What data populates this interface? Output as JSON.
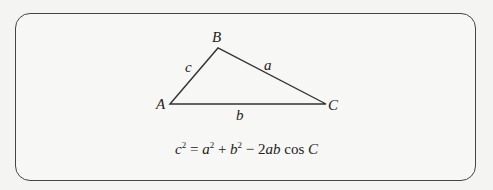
{
  "figure": {
    "type": "triangle-diagram",
    "vertices": [
      {
        "label": "A",
        "x": 170,
        "y": 104
      },
      {
        "label": "B",
        "x": 218,
        "y": 48
      },
      {
        "label": "C",
        "x": 326,
        "y": 104
      }
    ],
    "sides": [
      {
        "label": "c",
        "between": "A-B"
      },
      {
        "label": "a",
        "between": "B-C"
      },
      {
        "label": "b",
        "between": "A-C"
      }
    ],
    "labels": {
      "A": "A",
      "B": "B",
      "C": "C",
      "a": "a",
      "b": "b",
      "c": "c"
    },
    "equation": {
      "c": "c",
      "c_exp": "2",
      "eq": " = ",
      "a": "a",
      "a_exp": "2",
      "plus": " + ",
      "b": "b",
      "b_exp": "2",
      "minus": " − 2",
      "ab": "ab",
      "cos": " cos ",
      "C": "C"
    },
    "stroke_color": "#333333"
  }
}
